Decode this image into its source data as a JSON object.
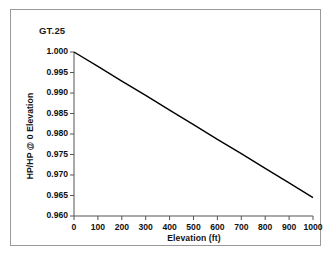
{
  "figure": {
    "frame_color": "#9a9a9a",
    "background": "#ffffff"
  },
  "chart_data": {
    "type": "line",
    "title": "GT.25",
    "xlabel": "Elevation (ft)",
    "ylabel": "HP/HP @ 0 Elevation",
    "x": [
      0,
      100,
      200,
      300,
      400,
      500,
      600,
      700,
      800,
      900,
      1000
    ],
    "values": [
      1.0,
      0.9965,
      0.9929,
      0.9894,
      0.9858,
      0.9823,
      0.9787,
      0.9752,
      0.9716,
      0.9681,
      0.9645
    ],
    "series": [
      {
        "name": "HP ratio vs elevation",
        "color": "#000000",
        "values": [
          1.0,
          0.9965,
          0.9929,
          0.9894,
          0.9858,
          0.9823,
          0.9787,
          0.9752,
          0.9716,
          0.9681,
          0.9645
        ]
      }
    ],
    "xlim": [
      0,
      1000
    ],
    "ylim": [
      0.96,
      1.0
    ],
    "xticks": [
      0,
      100,
      200,
      300,
      400,
      500,
      600,
      700,
      800,
      900,
      1000
    ],
    "xtick_labels": [
      "0",
      "100",
      "200",
      "300",
      "400",
      "500",
      "600",
      "700",
      "800",
      "900",
      "1000"
    ],
    "yticks": [
      0.96,
      0.965,
      0.97,
      0.975,
      0.98,
      0.985,
      0.99,
      0.995,
      1.0
    ],
    "ytick_labels": [
      "0.960",
      "0.965",
      "0.970",
      "0.975",
      "0.980",
      "0.985",
      "0.990",
      "0.995",
      "1.000"
    ],
    "grid": false,
    "legend": null,
    "legend_position": "none",
    "line_color": "#000000",
    "axis_color": "#555555"
  }
}
